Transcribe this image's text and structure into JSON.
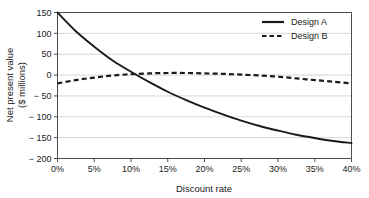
{
  "chart_data": {
    "type": "line",
    "title": "",
    "xlabel": "Discount rate",
    "ylabel": "Net present value\n($ millions)",
    "ylabel_line1": "Net present value",
    "ylabel_line2": "($ millions)",
    "xlim": [
      0,
      40
    ],
    "ylim": [
      -200,
      150
    ],
    "grid": true,
    "grid_axis": "y",
    "legend_position": "top-right",
    "x_tick_labels": [
      "0%",
      "5%",
      "10%",
      "15%",
      "20%",
      "25%",
      "30%",
      "35%",
      "40%"
    ],
    "x_tick_values": [
      0,
      5,
      10,
      15,
      20,
      25,
      30,
      35,
      40
    ],
    "y_tick_labels": [
      "150",
      "100",
      "50",
      "0",
      "− 50",
      "− 100",
      "− 150",
      "− 200"
    ],
    "y_tick_values": [
      150,
      100,
      50,
      0,
      -50,
      -100,
      -150,
      -200
    ],
    "x": [
      0,
      2.5,
      5,
      7.5,
      10,
      12.5,
      15,
      17.5,
      20,
      22.5,
      25,
      27.5,
      30,
      32.5,
      35,
      37.5,
      40
    ],
    "series": [
      {
        "name": "Design A",
        "style": "solid",
        "color": "#1a1a1a",
        "values": [
          150,
          105,
          68,
          35,
          8,
          -17,
          -40,
          -60,
          -78,
          -94,
          -109,
          -122,
          -133,
          -143,
          -151,
          -158,
          -163
        ]
      },
      {
        "name": "Design B",
        "style": "dashed",
        "color": "#1a1a1a",
        "values": [
          -20,
          -12,
          -6,
          -1,
          2,
          4,
          5,
          5,
          4,
          3,
          1,
          -1,
          -4,
          -8,
          -12,
          -16,
          -20
        ]
      }
    ],
    "annotations": [],
    "crossover_note": "Design A crosses zero near 10.5%"
  },
  "legend": {
    "items": [
      {
        "label": "Design A",
        "style": "solid"
      },
      {
        "label": "Design B",
        "style": "dashed"
      }
    ]
  },
  "colors": {
    "axis": "#4d4d4d",
    "grid": "#cccccc",
    "series": "#1a1a1a",
    "background": "#ffffff"
  }
}
